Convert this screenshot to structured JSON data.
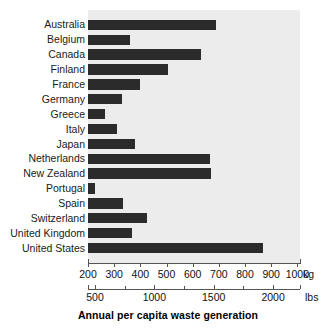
{
  "chart_data": {
    "type": "bar",
    "orientation": "horizontal",
    "title": "Annual per capita waste generation",
    "xlabel": "Annual per capita waste generation",
    "ylabel": "",
    "categories": [
      "Australia",
      "Belgium",
      "Canada",
      "Finland",
      "France",
      "Germany",
      "Greece",
      "Italy",
      "Japan",
      "Netherlands",
      "New Zealand",
      "Portugal",
      "Spain",
      "Switzerland",
      "United Kingdom",
      "United States"
    ],
    "values": [
      690,
      360,
      630,
      505,
      400,
      330,
      265,
      310,
      380,
      665,
      670,
      225,
      335,
      425,
      370,
      870
    ],
    "value_unit": "kg",
    "xlim": [
      200,
      1010
    ],
    "grid": false,
    "legend": null,
    "bar_color": "#2b2b2b",
    "plot_background": "#ececec",
    "axes": [
      {
        "name": "kg-axis",
        "unit_label": "kg",
        "ticks": [
          200,
          300,
          400,
          500,
          600,
          700,
          800,
          900,
          1000
        ],
        "tick_labels": [
          "200",
          "300",
          "400",
          "500",
          "600",
          "700",
          "800",
          "900",
          "1000"
        ]
      },
      {
        "name": "lbs-axis",
        "unit_label": "lbs",
        "ticks": [
          500,
          1000,
          1500,
          2000
        ],
        "tick_labels": [
          "500",
          "1000",
          "1500",
          "2000"
        ],
        "minor_ticks": [
          750,
          1250,
          1750,
          2250
        ]
      }
    ]
  }
}
